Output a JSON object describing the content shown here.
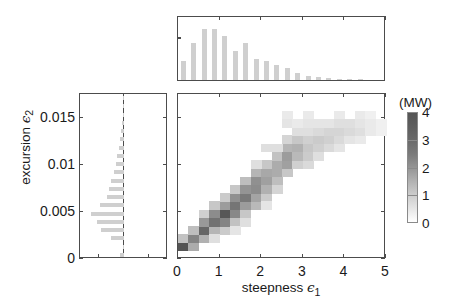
{
  "figure": {
    "width": 452,
    "height": 302,
    "background": "#ffffff"
  },
  "axis_labels": {
    "x_title_text": "steepness",
    "x_title_symbol": "ϵ",
    "x_title_subscript": "1",
    "y_title_text": "excursion",
    "y_title_symbol": "ϵ",
    "y_title_subscript": "2"
  },
  "colorbar": {
    "title": "(MW)",
    "ticks": [
      0,
      1,
      2,
      3,
      4
    ],
    "tick_labels": [
      "0",
      "1",
      "2",
      "3",
      "4"
    ],
    "vmin": 0,
    "vmax": 4,
    "colormap": "grayscale-inverted",
    "low_color": "#ffffff",
    "high_color": "#555555"
  },
  "chart_data": {
    "type": "heatmap",
    "title": "",
    "xlabel": "steepness ϵ₁",
    "ylabel": "excursion ϵ₂",
    "xlim": [
      0,
      5
    ],
    "ylim": [
      0,
      0.0175
    ],
    "xticks": [
      0,
      1,
      2,
      3,
      4,
      5
    ],
    "xtick_labels": [
      "0",
      "1",
      "2",
      "3",
      "4",
      "5"
    ],
    "yticks": [
      0,
      0.005,
      0.01,
      0.015
    ],
    "ytick_labels": [
      "0",
      "0.005",
      "0.01",
      "0.015"
    ],
    "grid": false,
    "legend": "colorbar-right",
    "value_unit": "MW",
    "value_range": [
      0,
      4
    ],
    "cell_size_x": 0.25,
    "cell_size_y": 0.000875,
    "cells": [
      {
        "x": 0.125,
        "y": 0.00131,
        "v": 3.9
      },
      {
        "x": 0.125,
        "y": 0.00219,
        "v": 1.1
      },
      {
        "x": 0.375,
        "y": 0.00131,
        "v": 1.6
      },
      {
        "x": 0.375,
        "y": 0.00219,
        "v": 2.6
      },
      {
        "x": 0.375,
        "y": 0.00306,
        "v": 1.2
      },
      {
        "x": 0.625,
        "y": 0.00219,
        "v": 1.5
      },
      {
        "x": 0.625,
        "y": 0.00306,
        "v": 3.4
      },
      {
        "x": 0.625,
        "y": 0.00394,
        "v": 2.1
      },
      {
        "x": 0.625,
        "y": 0.00481,
        "v": 0.8
      },
      {
        "x": 0.875,
        "y": 0.00306,
        "v": 1.4
      },
      {
        "x": 0.875,
        "y": 0.00394,
        "v": 3.1
      },
      {
        "x": 0.875,
        "y": 0.00481,
        "v": 2.4
      },
      {
        "x": 0.875,
        "y": 0.00569,
        "v": 1.0
      },
      {
        "x": 1.125,
        "y": 0.00306,
        "v": 0.9
      },
      {
        "x": 1.125,
        "y": 0.00394,
        "v": 2.6
      },
      {
        "x": 1.125,
        "y": 0.00481,
        "v": 3.8
      },
      {
        "x": 1.125,
        "y": 0.00569,
        "v": 2.0
      },
      {
        "x": 1.125,
        "y": 0.00656,
        "v": 0.9
      },
      {
        "x": 1.375,
        "y": 0.00394,
        "v": 1.1
      },
      {
        "x": 1.375,
        "y": 0.00481,
        "v": 2.5
      },
      {
        "x": 1.375,
        "y": 0.00569,
        "v": 3.0
      },
      {
        "x": 1.375,
        "y": 0.00656,
        "v": 2.3
      },
      {
        "x": 1.375,
        "y": 0.00744,
        "v": 1.0
      },
      {
        "x": 1.625,
        "y": 0.00481,
        "v": 1.0
      },
      {
        "x": 1.625,
        "y": 0.00569,
        "v": 2.0
      },
      {
        "x": 1.625,
        "y": 0.00656,
        "v": 2.9
      },
      {
        "x": 1.625,
        "y": 0.00744,
        "v": 2.2
      },
      {
        "x": 1.625,
        "y": 0.00831,
        "v": 1.2
      },
      {
        "x": 1.875,
        "y": 0.00569,
        "v": 1.3
      },
      {
        "x": 1.875,
        "y": 0.00656,
        "v": 1.8
      },
      {
        "x": 1.875,
        "y": 0.00744,
        "v": 2.4
      },
      {
        "x": 1.875,
        "y": 0.00831,
        "v": 2.3
      },
      {
        "x": 1.875,
        "y": 0.00919,
        "v": 1.4
      },
      {
        "x": 2.125,
        "y": 0.00656,
        "v": 0.9
      },
      {
        "x": 2.125,
        "y": 0.00744,
        "v": 1.5
      },
      {
        "x": 2.125,
        "y": 0.00831,
        "v": 1.9
      },
      {
        "x": 2.125,
        "y": 0.00919,
        "v": 1.7
      },
      {
        "x": 2.125,
        "y": 0.01006,
        "v": 1.0
      },
      {
        "x": 2.375,
        "y": 0.00744,
        "v": 0.7
      },
      {
        "x": 2.375,
        "y": 0.00831,
        "v": 1.2
      },
      {
        "x": 2.375,
        "y": 0.00919,
        "v": 1.6
      },
      {
        "x": 2.375,
        "y": 0.01006,
        "v": 1.6
      },
      {
        "x": 2.375,
        "y": 0.01094,
        "v": 1.1
      },
      {
        "x": 2.625,
        "y": 0.00919,
        "v": 1.0
      },
      {
        "x": 2.625,
        "y": 0.01006,
        "v": 1.9
      },
      {
        "x": 2.625,
        "y": 0.01094,
        "v": 2.0
      },
      {
        "x": 2.625,
        "y": 0.01181,
        "v": 1.4
      },
      {
        "x": 2.625,
        "y": 0.01269,
        "v": 0.7
      },
      {
        "x": 2.875,
        "y": 0.01006,
        "v": 0.8
      },
      {
        "x": 2.875,
        "y": 0.01094,
        "v": 1.3
      },
      {
        "x": 2.875,
        "y": 0.01181,
        "v": 1.5
      },
      {
        "x": 2.875,
        "y": 0.01269,
        "v": 1.0
      },
      {
        "x": 3.125,
        "y": 0.01006,
        "v": 0.6
      },
      {
        "x": 3.125,
        "y": 0.01094,
        "v": 0.9
      },
      {
        "x": 3.125,
        "y": 0.01181,
        "v": 1.0
      },
      {
        "x": 3.125,
        "y": 0.01269,
        "v": 0.8
      },
      {
        "x": 3.125,
        "y": 0.01356,
        "v": 0.5
      },
      {
        "x": 3.375,
        "y": 0.01094,
        "v": 0.5
      },
      {
        "x": 3.375,
        "y": 0.01181,
        "v": 0.8
      },
      {
        "x": 3.375,
        "y": 0.01269,
        "v": 0.9
      },
      {
        "x": 3.375,
        "y": 0.01356,
        "v": 0.6
      },
      {
        "x": 3.625,
        "y": 0.01181,
        "v": 0.6
      },
      {
        "x": 3.625,
        "y": 0.01269,
        "v": 0.8
      },
      {
        "x": 3.625,
        "y": 0.01356,
        "v": 0.7
      },
      {
        "x": 3.625,
        "y": 0.01444,
        "v": 0.4
      },
      {
        "x": 3.875,
        "y": 0.01181,
        "v": 0.4
      },
      {
        "x": 3.875,
        "y": 0.01269,
        "v": 0.6
      },
      {
        "x": 3.875,
        "y": 0.01356,
        "v": 0.7
      },
      {
        "x": 3.875,
        "y": 0.01444,
        "v": 0.5
      },
      {
        "x": 4.125,
        "y": 0.01269,
        "v": 0.4
      },
      {
        "x": 4.125,
        "y": 0.01356,
        "v": 0.6
      },
      {
        "x": 4.125,
        "y": 0.01444,
        "v": 0.5
      },
      {
        "x": 4.375,
        "y": 0.01269,
        "v": 0.3
      },
      {
        "x": 4.375,
        "y": 0.01356,
        "v": 0.5
      },
      {
        "x": 4.375,
        "y": 0.01444,
        "v": 0.4
      },
      {
        "x": 4.625,
        "y": 0.01356,
        "v": 0.3
      },
      {
        "x": 4.625,
        "y": 0.01444,
        "v": 0.3
      },
      {
        "x": 2.125,
        "y": 0.01181,
        "v": 0.5
      },
      {
        "x": 2.375,
        "y": 0.01181,
        "v": 0.5
      },
      {
        "x": 2.875,
        "y": 0.01356,
        "v": 0.5
      },
      {
        "x": 3.375,
        "y": 0.01444,
        "v": 0.4
      },
      {
        "x": 2.625,
        "y": 0.01444,
        "v": 0.4
      },
      {
        "x": 2.875,
        "y": 0.01444,
        "v": 0.3
      },
      {
        "x": 3.125,
        "y": 0.01444,
        "v": 0.4
      },
      {
        "x": 1.875,
        "y": 0.01006,
        "v": 0.5
      },
      {
        "x": 2.125,
        "y": 0.00569,
        "v": 0.4
      },
      {
        "x": 1.625,
        "y": 0.00394,
        "v": 0.5
      },
      {
        "x": 1.375,
        "y": 0.00306,
        "v": 0.4
      },
      {
        "x": 0.875,
        "y": 0.00219,
        "v": 0.5
      },
      {
        "x": 4.375,
        "y": 0.01531,
        "v": 0.3
      },
      {
        "x": 3.875,
        "y": 0.01531,
        "v": 0.3
      },
      {
        "x": 3.125,
        "y": 0.01531,
        "v": 0.3
      },
      {
        "x": 2.625,
        "y": 0.01531,
        "v": 0.3
      },
      {
        "x": 4.625,
        "y": 0.01531,
        "v": 0.2
      },
      {
        "x": 4.875,
        "y": 0.01444,
        "v": 0.2
      },
      {
        "x": 4.875,
        "y": 0.01356,
        "v": 0.2
      }
    ]
  },
  "top_histogram": {
    "orientation": "vertical",
    "xlim": [
      0,
      5
    ],
    "bin_width": 0.25,
    "bin_centers": [
      0.125,
      0.375,
      0.625,
      0.875,
      1.125,
      1.375,
      1.625,
      1.875,
      2.125,
      2.375,
      2.625,
      2.875,
      3.125,
      3.375,
      3.625,
      3.875,
      4.125,
      4.375,
      4.625,
      4.875
    ],
    "counts": [
      0.33,
      0.62,
      0.86,
      0.86,
      0.74,
      0.5,
      0.62,
      0.36,
      0.33,
      0.26,
      0.21,
      0.12,
      0.07,
      0.05,
      0.03,
      0.02,
      0.01,
      0.01,
      0.0,
      0.0
    ],
    "bar_color": "#cfcfcf",
    "max_normalized": 1.0
  },
  "left_histogram": {
    "orientation": "horizontal-left",
    "ylim": [
      0,
      0.0175
    ],
    "bin_height": 0.000875,
    "bin_centers": [
      0.00044,
      0.00131,
      0.00219,
      0.00306,
      0.00394,
      0.00481,
      0.00569,
      0.00656,
      0.00744,
      0.00831,
      0.00919,
      0.01006,
      0.01094,
      0.01181,
      0.01269,
      0.01356,
      0.01444,
      0.01531,
      0.01619,
      0.01706
    ],
    "counts": [
      0.1,
      0.02,
      0.33,
      0.6,
      0.72,
      0.88,
      0.62,
      0.46,
      0.4,
      0.33,
      0.27,
      0.22,
      0.18,
      0.13,
      0.1,
      0.07,
      0.05,
      0.03,
      0.02,
      0.01
    ],
    "bar_color": "#cfcfcf",
    "max_normalized": 1.0
  }
}
